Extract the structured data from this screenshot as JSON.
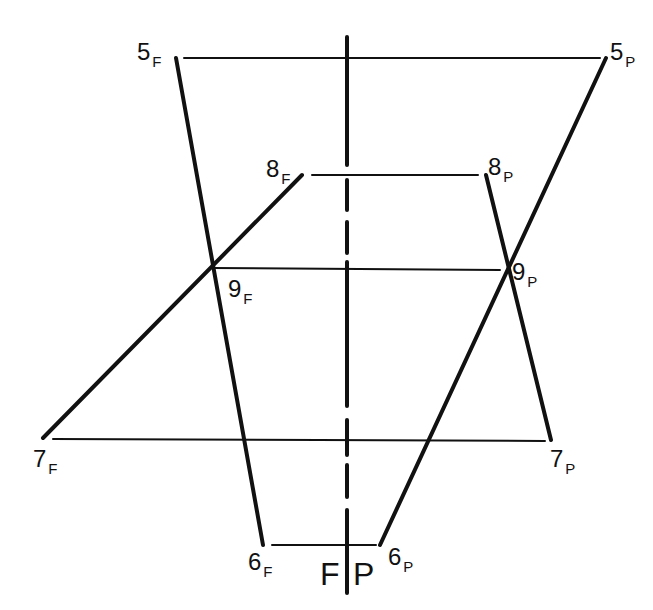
{
  "diagram": {
    "type": "projection-diagram",
    "colors": {
      "ink": "#111111",
      "background": "#ffffff"
    },
    "center_axis": {
      "x": 347,
      "segments": [
        [
          37,
          165
        ],
        [
          180,
          210
        ],
        [
          222,
          253
        ],
        [
          262,
          406
        ],
        [
          420,
          455
        ],
        [
          465,
          497
        ],
        [
          510,
          593
        ]
      ]
    },
    "lines": [
      {
        "id": "h5",
        "x1": 184,
        "y1": 58,
        "x2": 600,
        "y2": 58,
        "weight": 2
      },
      {
        "id": "h8",
        "x1": 312,
        "y1": 175,
        "x2": 478,
        "y2": 175,
        "weight": 2
      },
      {
        "id": "h9",
        "x1": 212,
        "y1": 268,
        "x2": 500,
        "y2": 270,
        "weight": 2
      },
      {
        "id": "h7",
        "x1": 53,
        "y1": 439,
        "x2": 545,
        "y2": 441,
        "weight": 2
      },
      {
        "id": "h6",
        "x1": 272,
        "y1": 545,
        "x2": 376,
        "y2": 545,
        "weight": 2
      },
      {
        "id": "5F-6F",
        "x1": 176,
        "y1": 58,
        "x2": 263,
        "y2": 545,
        "weight": 4
      },
      {
        "id": "5P-6P",
        "x1": 606,
        "y1": 58,
        "x2": 380,
        "y2": 545,
        "weight": 4
      },
      {
        "id": "8F-7F",
        "x1": 302,
        "y1": 175,
        "x2": 43,
        "y2": 438,
        "weight": 4
      },
      {
        "id": "8P-7P",
        "x1": 486,
        "y1": 175,
        "x2": 551,
        "y2": 440,
        "weight": 4
      }
    ],
    "labels": [
      {
        "id": "5F",
        "num": "5",
        "sub": "F",
        "x": 137,
        "y": 40
      },
      {
        "id": "5P",
        "num": "5",
        "sub": "P",
        "x": 610,
        "y": 40
      },
      {
        "id": "8F",
        "num": "8",
        "sub": "F",
        "x": 266,
        "y": 157
      },
      {
        "id": "8P",
        "num": "8",
        "sub": "P",
        "x": 488,
        "y": 155
      },
      {
        "id": "9F",
        "num": "9",
        "sub": "F",
        "x": 228,
        "y": 277
      },
      {
        "id": "9P",
        "num": "9",
        "sub": "P",
        "x": 512,
        "y": 260
      },
      {
        "id": "7F",
        "num": "7",
        "sub": "F",
        "x": 33,
        "y": 447
      },
      {
        "id": "7P",
        "num": "7",
        "sub": "P",
        "x": 550,
        "y": 447
      },
      {
        "id": "6F",
        "num": "6",
        "sub": "F",
        "x": 248,
        "y": 550
      },
      {
        "id": "6P",
        "num": "6",
        "sub": "P",
        "x": 388,
        "y": 545
      }
    ],
    "axis_labels": [
      {
        "id": "F",
        "text": "F",
        "x": 320,
        "y": 558
      },
      {
        "id": "P",
        "text": "P",
        "x": 353,
        "y": 558
      }
    ]
  }
}
